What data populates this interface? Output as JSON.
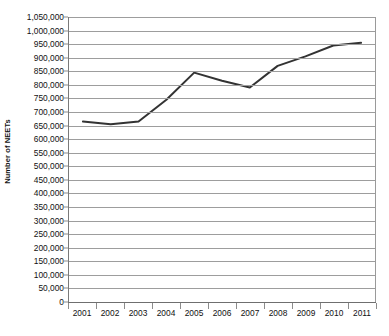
{
  "chart_data": {
    "type": "line",
    "title": "",
    "xlabel": "",
    "ylabel": "Number of NEETs",
    "categories": [
      "2001",
      "2002",
      "2003",
      "2004",
      "2005",
      "2006",
      "2007",
      "2008",
      "2009",
      "2010",
      "2011"
    ],
    "values": [
      665000,
      655000,
      665000,
      745000,
      845000,
      815000,
      790000,
      870000,
      905000,
      945000,
      955000
    ],
    "series": [
      {
        "name": "Number of NEETs",
        "values": [
          665000,
          655000,
          665000,
          745000,
          845000,
          815000,
          790000,
          870000,
          905000,
          945000,
          955000
        ],
        "color": "#333333"
      }
    ],
    "ylim": [
      0,
      1050000
    ],
    "ytick_step": 50000,
    "ytick_labels": [
      "1,050,000",
      "1,000,000",
      "950,000",
      "900,000",
      "850,000",
      "800,000",
      "750,000",
      "700,000",
      "650,000",
      "600,000",
      "550,000",
      "500,000",
      "450,000",
      "400,000",
      "350,000",
      "300,000",
      "250,000",
      "200,000",
      "150,000",
      "100,000",
      "50,000",
      "0"
    ],
    "ytick_values": [
      1050000,
      1000000,
      950000,
      900000,
      850000,
      800000,
      750000,
      700000,
      650000,
      600000,
      550000,
      500000,
      450000,
      400000,
      350000,
      300000,
      250000,
      200000,
      150000,
      100000,
      50000,
      0
    ],
    "grid": true,
    "grid_color": "#9d9d9d",
    "legend": false,
    "legend_position": "none",
    "line_color": "#333333",
    "line_width": 2,
    "markers": false,
    "background": "#ffffff",
    "axis_color": "#7a7a7a"
  }
}
